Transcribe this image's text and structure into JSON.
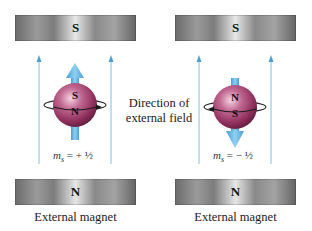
{
  "diagram": {
    "center_label": {
      "line1": "Direction of",
      "line2": "external field"
    },
    "left_panel": {
      "top_magnet_pole": "S",
      "bottom_magnet_pole": "N",
      "caption": "External magnet",
      "electron": {
        "upper_pole": "S",
        "lower_pole": "N",
        "spin_arrow_direction": "up"
      },
      "quantum_number_label": "m",
      "quantum_number_subscript": "s",
      "quantum_number_value": "= + ½"
    },
    "right_panel": {
      "top_magnet_pole": "S",
      "bottom_magnet_pole": "N",
      "caption": "External magnet",
      "electron": {
        "upper_pole": "N",
        "lower_pole": "S",
        "spin_arrow_direction": "down"
      },
      "quantum_number_label": "m",
      "quantum_number_subscript": "s",
      "quantum_number_value": "= − ½"
    },
    "colors": {
      "field_line": "#6fb8dc",
      "spin_arrow": "#5aaee0",
      "sphere": "#a8466f",
      "magnet": "#9a9a9a"
    }
  }
}
